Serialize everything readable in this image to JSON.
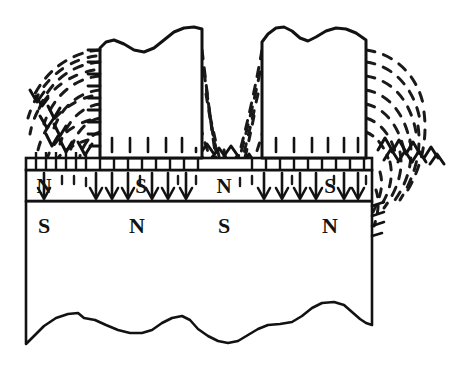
{
  "figure": {
    "width": 455,
    "height": 376,
    "colors": {
      "ink": "#121212",
      "background": "#ffffff",
      "field_line": "#1a1a1a"
    }
  },
  "medium": {
    "left": 26,
    "right": 372,
    "recording_layer": {
      "top": 170,
      "bottom": 201,
      "label_text": "magnetic recording layer",
      "domain_labels": [
        {
          "text": "N",
          "x": 44,
          "y": 193
        },
        {
          "text": "S",
          "x": 141,
          "y": 193
        },
        {
          "text": "N",
          "x": 224,
          "y": 193
        },
        {
          "text": "S",
          "x": 330,
          "y": 193
        }
      ]
    },
    "soft_underlayer": {
      "top": 201,
      "bottom": 330,
      "label_text": "soft magnetic underlayer",
      "domain_labels": [
        {
          "text": "S",
          "x": 44,
          "y": 233
        },
        {
          "text": "N",
          "x": 137,
          "y": 233
        },
        {
          "text": "S",
          "x": 224,
          "y": 233
        },
        {
          "text": "N",
          "x": 330,
          "y": 233
        }
      ]
    },
    "spacing_band": {
      "top": 158,
      "bottom": 170,
      "label_text": "head-medium spacing band",
      "tick_count": 26
    },
    "torn_bottom_edge": {
      "label_text": "broken-away bottom edge",
      "path": "M 26,330 L 26,344 L 34,336 L 44,326 L 56,318 L 68,314 L 78,313 L 84,318 L 95,320 L 106,325 L 118,330 L 130,333 L 142,333 L 152,330 L 162,323 L 172,318 L 182,316 L 190,320 L 198,329 L 208,336 L 218,341 L 228,343 L 238,341 L 248,335 L 258,329 L 268,325 L 280,324 L 292,322 L 302,316 L 312,308 L 322,303 L 334,302 L 344,305 L 352,312 L 360,319 L 366,323 L 372,325 L 372,330 Z"
    }
  },
  "poles": {
    "label_text": "write head pole pieces",
    "left_pole": {
      "name": "left-pole-piece",
      "x": 100,
      "right": 202,
      "bottom": 158,
      "top": 44,
      "torn_top_path": "M 100,158 L 100,48 L 106,42 L 114,40 L 124,44 L 134,50 L 144,52 L 154,48 L 164,40 L 174,32 L 184,28 L 194,27 L 202,29 L 202,158 Z",
      "interior_dash_count": 6,
      "edge_hatch_count": 9
    },
    "right_pole": {
      "name": "right-pole-piece",
      "x": 262,
      "right": 366,
      "bottom": 158,
      "top": 34,
      "torn_top_path": "M 262,158 L 262,42 L 268,34 L 276,28 L 284,27 L 292,31 L 300,38 L 308,41 L 316,37 L 326,31 L 336,28 L 346,29 L 356,33 L 366,40 L 366,158 Z",
      "interior_dash_count": 6,
      "edge_hatch_count": 9
    }
  },
  "field": {
    "label_text": "magnetic flux field lines (dashed)",
    "left_fringe_arcs": 7,
    "right_fringe_arcs": 7,
    "gap_flux_lines": 12,
    "downward_arrows_count": 14,
    "chevron_markers": 9
  }
}
